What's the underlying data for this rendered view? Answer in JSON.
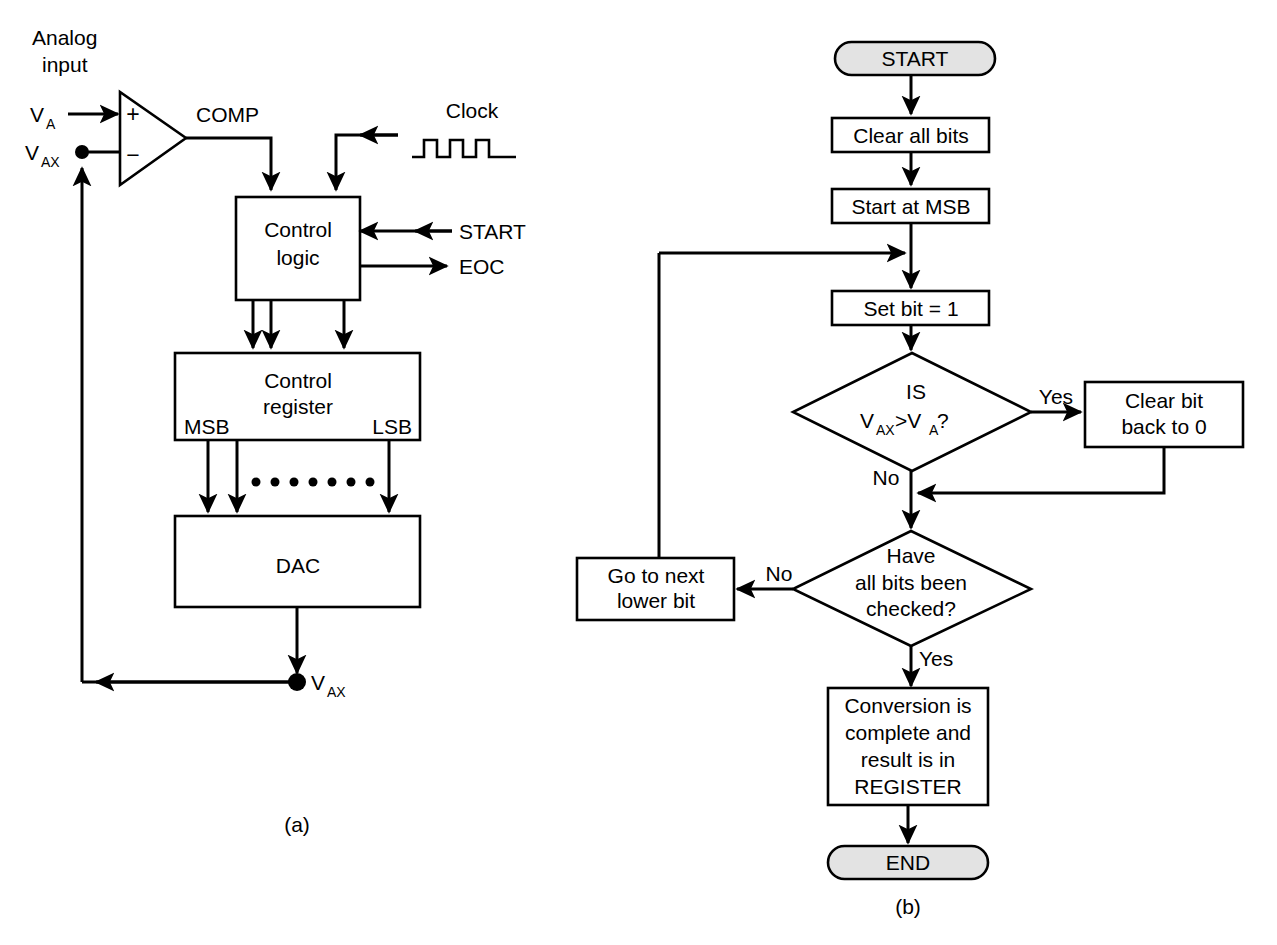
{
  "figure": {
    "panel_a_caption": "(a)",
    "panel_b_caption": "(b)"
  },
  "panel_a": {
    "title_note": "Successive approximation ADC block diagram",
    "labels": {
      "analog_input_line1": "Analog",
      "analog_input_line2": "input",
      "va": "V",
      "va_sub": "A",
      "vax": "V",
      "vax_sub": "AX",
      "vax_out": "V",
      "vax_out_sub": "AX",
      "comp": "COMP",
      "clock": "Clock",
      "start": "START",
      "eoc": "EOC",
      "msb": "MSB",
      "lsb": "LSB",
      "plus": "+",
      "minus": "−"
    },
    "blocks": [
      {
        "id": "control-logic",
        "line1": "Control",
        "line2": "logic"
      },
      {
        "id": "control-register",
        "line1": "Control",
        "line2": "register"
      },
      {
        "id": "dac",
        "line1": "DAC",
        "line2": ""
      }
    ]
  },
  "panel_b": {
    "title_note": "Successive approximation conversion flowchart",
    "nodes": {
      "start": "START",
      "clear_all_bits": "Clear all bits",
      "start_at_msb": "Start at MSB",
      "set_bit": "Set bit = 1",
      "decision1_line1": "IS",
      "decision1_line2_a": "V",
      "decision1_line2_a_sub": "AX",
      "decision1_line2_gt": ">V",
      "decision1_line2_b_sub": "A",
      "decision1_line2_q": " ?",
      "clear_bit_line1": "Clear bit",
      "clear_bit_line2": "back to 0",
      "decision2_line1": "Have",
      "decision2_line2": "all bits been",
      "decision2_line3": "checked?",
      "go_next_line1": "Go to next",
      "go_next_line2": "lower bit",
      "conversion_line1": "Conversion is",
      "conversion_line2": "complete and",
      "conversion_line3": "result is in",
      "conversion_line4": "REGISTER",
      "end": "END"
    },
    "edge_labels": {
      "decision1_yes": "Yes",
      "decision1_no": "No",
      "decision2_no": "No",
      "decision2_yes": "Yes"
    }
  },
  "colors": {
    "line": "#000000",
    "background": "#ffffff",
    "terminator_fill": "#e3e3e3",
    "shape_fill": "#ffffff"
  }
}
